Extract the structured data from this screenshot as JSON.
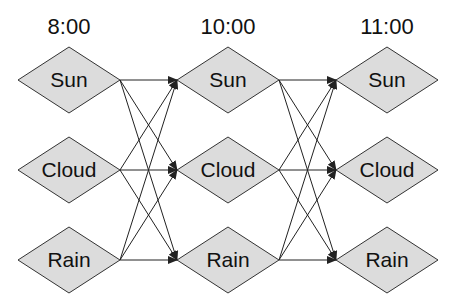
{
  "diagram": {
    "type": "trellis / state transition diagram",
    "columns": [
      {
        "time": "8:00",
        "states": [
          "Sun",
          "Cloud",
          "Rain"
        ]
      },
      {
        "time": "10:00",
        "states": [
          "Sun",
          "Cloud",
          "Rain"
        ]
      },
      {
        "time": "11:00",
        "states": [
          "Sun",
          "Cloud",
          "Rain"
        ]
      }
    ],
    "edges_description": "Every state at each time connects by an arrow to every state at the next time",
    "colors": {
      "node_fill": "#dcdcdc",
      "node_stroke": "#333333",
      "edge": "#222222",
      "background": "#ffffff"
    }
  }
}
